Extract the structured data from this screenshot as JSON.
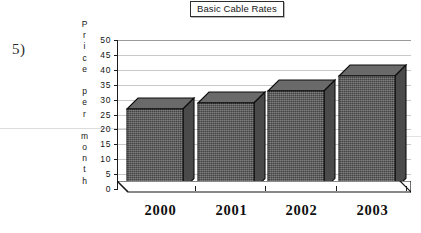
{
  "question_number": "5)",
  "chart_title": "Basic Cable Rates",
  "y_axis_caption_letters": [
    "P",
    "r",
    "i",
    "c",
    "e",
    "",
    "p",
    "e",
    "r",
    "",
    "m",
    "o",
    "n",
    "t",
    "h"
  ],
  "chart_data": {
    "type": "bar",
    "title": "Basic Cable Rates",
    "xlabel": "",
    "ylabel": "Price per month",
    "categories": [
      "2000",
      "2001",
      "2002",
      "2003"
    ],
    "values": [
      27,
      29,
      33,
      38
    ],
    "ylim": [
      0,
      50
    ],
    "ytick_labels": [
      "0",
      "5",
      "10",
      "15",
      "20",
      "25",
      "30",
      "35",
      "40",
      "45",
      "50"
    ],
    "ytick_values": [
      0,
      5,
      10,
      15,
      20,
      25,
      30,
      35,
      40,
      45,
      50
    ],
    "grid": true,
    "legend": "none",
    "style": "3d-column",
    "bar_color": "#595959",
    "bar_top_color": "#6a6a6a",
    "bar_side_color": "#4a4a4a",
    "gridline_color": "#c9c9c9",
    "axis_color": "#1c1c1c",
    "background": "#ffffff"
  }
}
